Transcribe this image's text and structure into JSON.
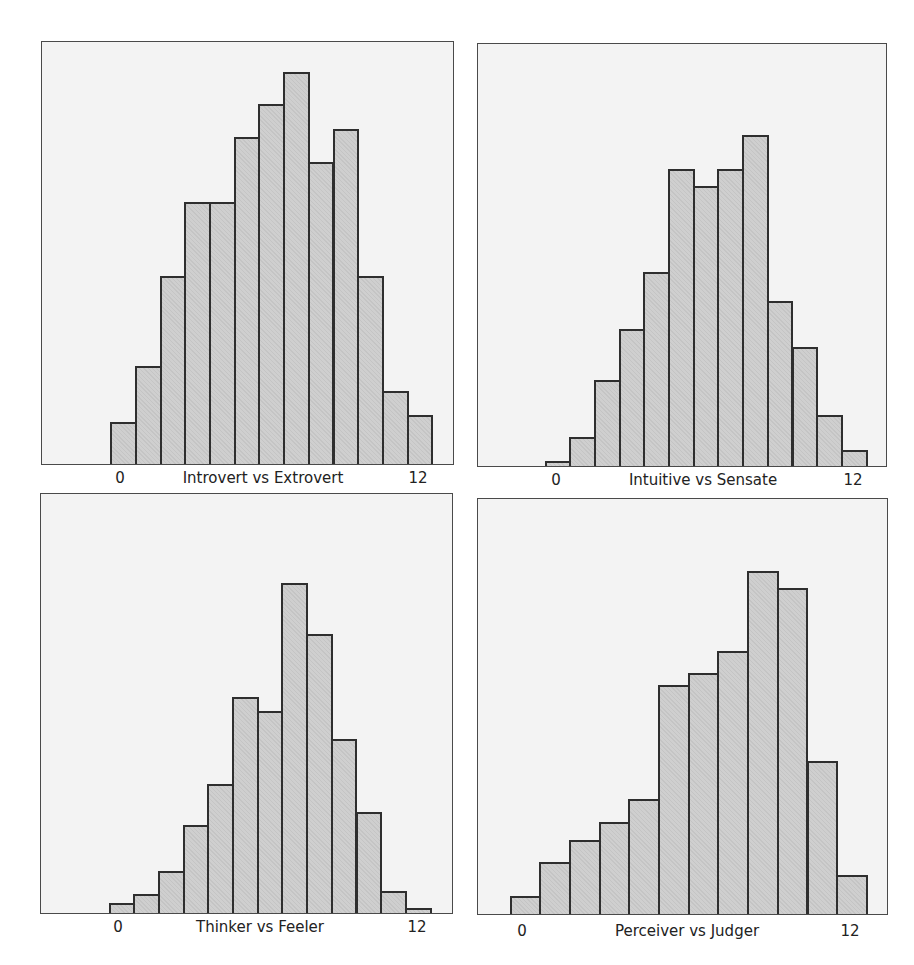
{
  "chart_data": [
    {
      "type": "bar",
      "title": "",
      "xlabel": "Introvert vs Extrovert",
      "ylabel": "",
      "xticks": [
        "0",
        "12"
      ],
      "xlim": [
        0,
        12
      ],
      "grid": false,
      "bin_centers": [
        0,
        1,
        2,
        3,
        4,
        5,
        6,
        7,
        8,
        9,
        10,
        11,
        12
      ],
      "values": [
        5,
        12,
        23,
        32,
        32,
        40,
        44,
        48,
        37,
        41,
        23,
        9,
        6
      ],
      "note": "No y-axis shown; values are relative frequencies estimated from bar heights"
    },
    {
      "type": "bar",
      "title": "",
      "xlabel": "Intuitive vs Sensate",
      "ylabel": "",
      "xticks": [
        "0",
        "12"
      ],
      "xlim": [
        0,
        12
      ],
      "grid": false,
      "bin_centers": [
        0,
        1,
        2,
        3,
        4,
        5,
        6,
        7,
        8,
        9,
        10,
        11,
        12
      ],
      "values": [
        1,
        4,
        10,
        17,
        24,
        36,
        34,
        36,
        40,
        20,
        15,
        6,
        2
      ]
    },
    {
      "type": "bar",
      "title": "",
      "xlabel": "Thinker vs Feeler",
      "ylabel": "",
      "xticks": [
        "0",
        "12"
      ],
      "xlim": [
        0,
        12
      ],
      "grid": false,
      "bin_centers": [
        0,
        1,
        2,
        3,
        4,
        5,
        6,
        7,
        8,
        9,
        10,
        11,
        12
      ],
      "values": [
        1,
        2,
        5,
        11,
        16,
        26,
        25,
        40,
        34,
        21,
        12,
        3,
        1
      ]
    },
    {
      "type": "bar",
      "title": "",
      "xlabel": "Perceiver vs Judger",
      "ylabel": "",
      "xticks": [
        "0",
        "12"
      ],
      "xlim": [
        0,
        12
      ],
      "grid": false,
      "bin_centers": [
        1,
        2,
        3,
        4,
        5,
        6,
        7,
        8,
        9,
        10,
        11,
        12
      ],
      "values": [
        2,
        6,
        9,
        11,
        14,
        28,
        29,
        32,
        42,
        40,
        19,
        5
      ]
    }
  ],
  "panels": [
    {
      "frame": {
        "left": 41,
        "top": 41,
        "width": 413,
        "height": 424
      },
      "bar_left": 110.7,
      "bar_width": 24.7,
      "bar_heights_px": [
        41.7,
        98.3,
        188.3,
        261.7,
        261.7,
        327.3,
        359.7,
        392.3,
        302.3,
        335,
        188,
        73.3,
        49
      ],
      "xlabel": "Introvert vs Extrovert",
      "tick_0": "0",
      "tick_12": "12",
      "tick_0_x": 120,
      "tick_12_x": 418,
      "xlabel_x": 263,
      "label_y": 469
    },
    {
      "frame": {
        "left": 477,
        "top": 43,
        "width": 410,
        "height": 424
      },
      "bar_left": 545,
      "bar_width": 24.7,
      "bar_heights_px": [
        5,
        29.4,
        85.7,
        137.4,
        194,
        297.4,
        280,
        297.4,
        330.7,
        165,
        119,
        50.7,
        16
      ],
      "xlabel": "Intuitive vs Sensate",
      "tick_0": "0",
      "tick_12": "12",
      "tick_0_x": 556,
      "tick_12_x": 853,
      "xlabel_x": 703,
      "label_y": 471
    },
    {
      "frame": {
        "left": 40,
        "top": 493,
        "width": 413,
        "height": 421
      },
      "bar_left": 109,
      "bar_width": 24.7,
      "bar_heights_px": [
        10,
        18.6,
        42.3,
        88.3,
        129,
        216,
        202.3,
        329.6,
        279,
        174.3,
        100.6,
        22.3,
        4.6
      ],
      "xlabel": "Thinker vs Feeler",
      "tick_0": "0",
      "tick_12": "12",
      "tick_0_x": 118,
      "tick_12_x": 417,
      "xlabel_x": 260,
      "label_y": 918
    },
    {
      "frame": {
        "left": 477,
        "top": 498,
        "width": 411,
        "height": 417
      },
      "bar_left": 510,
      "bar_width": 29.7,
      "bar_heights_px": [
        17.7,
        51.7,
        74.3,
        92.3,
        115,
        229,
        240.7,
        262.7,
        343,
        326.3,
        153.3,
        39
      ],
      "xlabel": "Perceiver vs Judger",
      "tick_0": "0",
      "tick_12": "12",
      "tick_0_x": 522,
      "tick_12_x": 850,
      "xlabel_x": 687,
      "label_y": 922
    }
  ],
  "colors": {
    "bar_fill": "#cfcfcf",
    "bar_edge": "#2e2e2e",
    "panel_bg": "#f3f3f3",
    "panel_border": "#4a4a4a"
  }
}
